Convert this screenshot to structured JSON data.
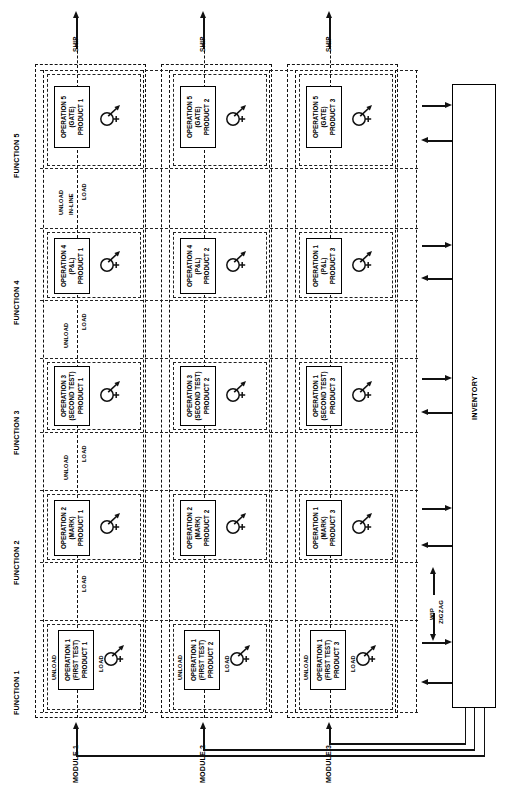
{
  "diagram": {
    "orientation": "rotated-90",
    "function_columns": [
      {
        "label": "FUNCTION 1"
      },
      {
        "label": "FUNCTION 2"
      },
      {
        "label": "FUNCTION 3"
      },
      {
        "label": "FUNCTION 4"
      },
      {
        "label": "FUNCTION 5"
      }
    ],
    "module_rows": [
      {
        "label": "MODULE 1"
      },
      {
        "label": "MODULE 2"
      },
      {
        "label": "MODULE 3"
      }
    ],
    "ship_labels": [
      "SHIP",
      "SHIP",
      "SHIP"
    ],
    "inventory": {
      "label": "INVENTORY"
    },
    "wip": {
      "line1": "WIP",
      "line2": "ZIGZAG"
    },
    "interface_labels": {
      "f1_f2": {
        "unload": "UNLOAD",
        "load": "LOAD"
      },
      "f2_f3": {
        "unload": "UNLOAD",
        "load": "LOAD"
      },
      "f3_f4": {
        "unload": "UNLOAD",
        "load": "LOAD"
      },
      "f4_f5": {
        "unload": "UNLOAD",
        "inline": "IN-LINE",
        "load": "LOAD"
      }
    },
    "cell_port_labels": {
      "unload": "UNLOAD",
      "load": "LOAD"
    },
    "cells": [
      [
        {
          "op": "OPERATION 1",
          "proc": "(FIRST TEST)",
          "prod": "PRODUCT 1"
        },
        {
          "op": "OPERATION 2",
          "proc": "(MARK)",
          "prod": "PRODUCT 1"
        },
        {
          "op": "OPERATION 3",
          "proc": "(SECOND TEST)",
          "prod": "PRODUCT 1"
        },
        {
          "op": "OPERATION 4",
          "proc": "(P&L)",
          "prod": "PRODUCT 1"
        },
        {
          "op": "OPERATION 5",
          "proc": "(GATE)",
          "prod": "PRODUCT 1"
        }
      ],
      [
        {
          "op": "OPERATION 1",
          "proc": "(FIRST TEST)",
          "prod": "PRODUCT 2"
        },
        {
          "op": "OPERATION 2",
          "proc": "(MARK)",
          "prod": "PRODUCT 2"
        },
        {
          "op": "OPERATION 3",
          "proc": "(SECOND TEST)",
          "prod": "PRODUCT 2"
        },
        {
          "op": "OPERATION 4",
          "proc": "(P&L)",
          "prod": "PRODUCT 2"
        },
        {
          "op": "OPERATION 5",
          "proc": "(GATE)",
          "prod": "PRODUCT 2"
        }
      ],
      [
        {
          "op": "OPERATION 1",
          "proc": "(FIRST TEST)",
          "prod": "PRODUCT 3"
        },
        {
          "op": "OPERATION 1",
          "proc": "(MARK)",
          "prod": "PRODUCT 3"
        },
        {
          "op": "OPERATION 1",
          "proc": "(SECOND TEST)",
          "prod": "PRODUCT 3"
        },
        {
          "op": "OPERATION 1",
          "proc": "(P&L)",
          "prod": "PRODUCT 3"
        },
        {
          "op": "OPERATION 5",
          "proc": "(GATE)",
          "prod": "PRODUCT 3"
        }
      ]
    ],
    "colors": {
      "line": "#111111",
      "background": "#ffffff"
    }
  }
}
